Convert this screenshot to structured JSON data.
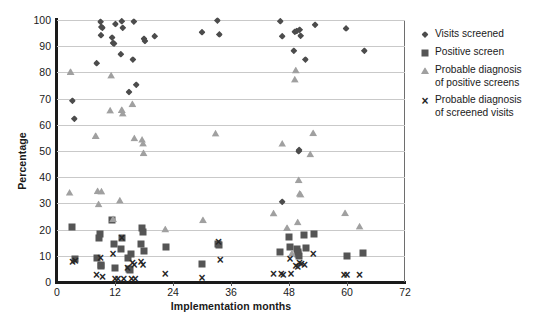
{
  "chart_data": {
    "type": "scatter",
    "title": "",
    "xlabel": "Implementation months",
    "ylabel": "Percentage",
    "xlim": [
      0,
      72
    ],
    "ylim": [
      0,
      100
    ],
    "xticks": [
      0,
      12,
      24,
      36,
      48,
      60,
      72
    ],
    "yticks": [
      0,
      10,
      20,
      30,
      40,
      50,
      60,
      70,
      80,
      90,
      100
    ],
    "grid": "horizontal",
    "legend_position": "right",
    "colors": {
      "visits_screened": "#4c4c4c",
      "positive_screen": "#555555",
      "probable_diagnosis_positive": "#a0a0a0",
      "probable_diagnosis_visits": "#262626",
      "gridline": "#c9c9c9",
      "axis": "#1a1a1a"
    },
    "series": [
      {
        "name": "Visits screened",
        "marker": "diamond",
        "color": "#4c4c4c",
        "points": [
          [
            3.2,
            69.2
          ],
          [
            3.6,
            62.3
          ],
          [
            8.2,
            83.5
          ],
          [
            9.0,
            99.3
          ],
          [
            9.2,
            97.3
          ],
          [
            9.4,
            97.0
          ],
          [
            9.1,
            94.2
          ],
          [
            11.4,
            93.3
          ],
          [
            11.6,
            91.2
          ],
          [
            11.8,
            91.0
          ],
          [
            12.1,
            98.5
          ],
          [
            13.4,
            99.5
          ],
          [
            13.6,
            97.0
          ],
          [
            13.2,
            86.9
          ],
          [
            15.9,
            99.4
          ],
          [
            15.7,
            84.9
          ],
          [
            14.9,
            72.5
          ],
          [
            16.4,
            75.3
          ],
          [
            18.0,
            92.8
          ],
          [
            18.2,
            92.0
          ],
          [
            20.2,
            93.8
          ],
          [
            30.0,
            95.3
          ],
          [
            33.2,
            99.8
          ],
          [
            33.6,
            94.5
          ],
          [
            46.2,
            99.5
          ],
          [
            46.6,
            93.8
          ],
          [
            49.2,
            95.5
          ],
          [
            49.6,
            95.8
          ],
          [
            50.2,
            96.3
          ],
          [
            50.4,
            94.0
          ],
          [
            49.0,
            88.3
          ],
          [
            51.4,
            84.9
          ],
          [
            50.0,
            49.9
          ],
          [
            50.1,
            50.4
          ],
          [
            46.6,
            30.6
          ],
          [
            53.4,
            98.2
          ],
          [
            59.8,
            96.8
          ],
          [
            63.6,
            88.3
          ]
        ]
      },
      {
        "name": "Positive screen",
        "marker": "square",
        "color": "#555555",
        "points": [
          [
            3.2,
            20.9
          ],
          [
            3.8,
            8.6
          ],
          [
            8.2,
            9.3
          ],
          [
            8.8,
            18.4
          ],
          [
            8.6,
            16.9
          ],
          [
            9.0,
            6.3
          ],
          [
            9.2,
            6.2
          ],
          [
            11.4,
            23.8
          ],
          [
            12.0,
            5.2
          ],
          [
            11.8,
            14.6
          ],
          [
            13.4,
            16.9
          ],
          [
            13.2,
            12.6
          ],
          [
            14.6,
            9.0
          ],
          [
            14.8,
            4.9
          ],
          [
            15.4,
            10.5
          ],
          [
            15.0,
            4.4
          ],
          [
            17.6,
            20.6
          ],
          [
            17.8,
            19.1
          ],
          [
            17.4,
            14.4
          ],
          [
            18.0,
            12.0
          ],
          [
            22.6,
            13.4
          ],
          [
            30.0,
            6.8
          ],
          [
            33.4,
            14.5
          ],
          [
            33.6,
            14.0
          ],
          [
            46.2,
            11.5
          ],
          [
            48.0,
            17.2
          ],
          [
            48.2,
            13.3
          ],
          [
            49.6,
            12.7
          ],
          [
            49.8,
            11.5
          ],
          [
            49.9,
            10.6
          ],
          [
            50.0,
            9.8
          ],
          [
            51.0,
            17.9
          ],
          [
            51.6,
            12.8
          ],
          [
            53.2,
            18.5
          ],
          [
            60.0,
            10.0
          ],
          [
            63.4,
            11.0
          ]
        ]
      },
      {
        "name": "Probable diagnosis of positive screens",
        "marker": "triangle",
        "color": "#a0a0a0",
        "points": [
          [
            2.8,
            80.3
          ],
          [
            2.6,
            34.2
          ],
          [
            8.0,
            55.9
          ],
          [
            8.4,
            34.8
          ],
          [
            9.2,
            34.6
          ],
          [
            8.6,
            29.8
          ],
          [
            11.2,
            78.9
          ],
          [
            11.0,
            65.6
          ],
          [
            11.6,
            24.1
          ],
          [
            13.4,
            65.8
          ],
          [
            13.6,
            64.4
          ],
          [
            13.0,
            31.2
          ],
          [
            15.6,
            68.0
          ],
          [
            16.0,
            55.0
          ],
          [
            17.6,
            54.4
          ],
          [
            17.8,
            53.0
          ],
          [
            17.9,
            49.3
          ],
          [
            22.4,
            20.2
          ],
          [
            30.2,
            23.8
          ],
          [
            32.8,
            56.8
          ],
          [
            44.8,
            26.3
          ],
          [
            46.6,
            52.9
          ],
          [
            47.6,
            20.8
          ],
          [
            49.4,
            80.9
          ],
          [
            49.2,
            77.4
          ],
          [
            50.0,
            39.0
          ],
          [
            50.2,
            33.8
          ],
          [
            50.4,
            33.5
          ],
          [
            49.8,
            22.9
          ],
          [
            48.6,
            11.0
          ],
          [
            53.0,
            57.0
          ],
          [
            52.4,
            48.9
          ],
          [
            59.6,
            26.4
          ],
          [
            62.6,
            21.3
          ]
        ]
      },
      {
        "name": "Probable diagnosis of screened visits",
        "marker": "x",
        "color": "#262626",
        "points": [
          [
            3.2,
            7.6
          ],
          [
            3.8,
            7.9
          ],
          [
            8.2,
            2.8
          ],
          [
            9.0,
            9.2
          ],
          [
            9.4,
            1.9
          ],
          [
            11.6,
            10.8
          ],
          [
            12.0,
            1.3
          ],
          [
            12.6,
            1.2
          ],
          [
            13.4,
            16.9
          ],
          [
            13.8,
            1.2
          ],
          [
            14.6,
            5.2
          ],
          [
            15.6,
            7.3
          ],
          [
            16.0,
            6.3
          ],
          [
            16.2,
            1.2
          ],
          [
            15.4,
            1.3
          ],
          [
            17.4,
            7.8
          ],
          [
            17.8,
            6.6
          ],
          [
            22.4,
            3.0
          ],
          [
            30.0,
            1.7
          ],
          [
            33.4,
            15.2
          ],
          [
            33.8,
            8.4
          ],
          [
            44.8,
            3.0
          ],
          [
            46.4,
            2.9
          ],
          [
            46.8,
            2.8
          ],
          [
            48.2,
            8.6
          ],
          [
            48.4,
            2.9
          ],
          [
            49.4,
            6.0
          ],
          [
            49.8,
            5.8
          ],
          [
            50.2,
            7.4
          ],
          [
            50.6,
            6.9
          ],
          [
            51.2,
            6.6
          ],
          [
            53.0,
            10.8
          ],
          [
            59.4,
            2.7
          ],
          [
            60.0,
            2.8
          ],
          [
            62.6,
            2.8
          ]
        ]
      }
    ]
  },
  "legend": {
    "items": [
      {
        "label": "Visits screened",
        "marker": "diamond-icon"
      },
      {
        "label": "Positive screen",
        "marker": "square-icon"
      },
      {
        "label": "Probable diagnosis\nof positive screens",
        "marker": "triangle-icon"
      },
      {
        "label": "Probable diagnosis\nof screened visits",
        "marker": "x-icon"
      }
    ]
  }
}
